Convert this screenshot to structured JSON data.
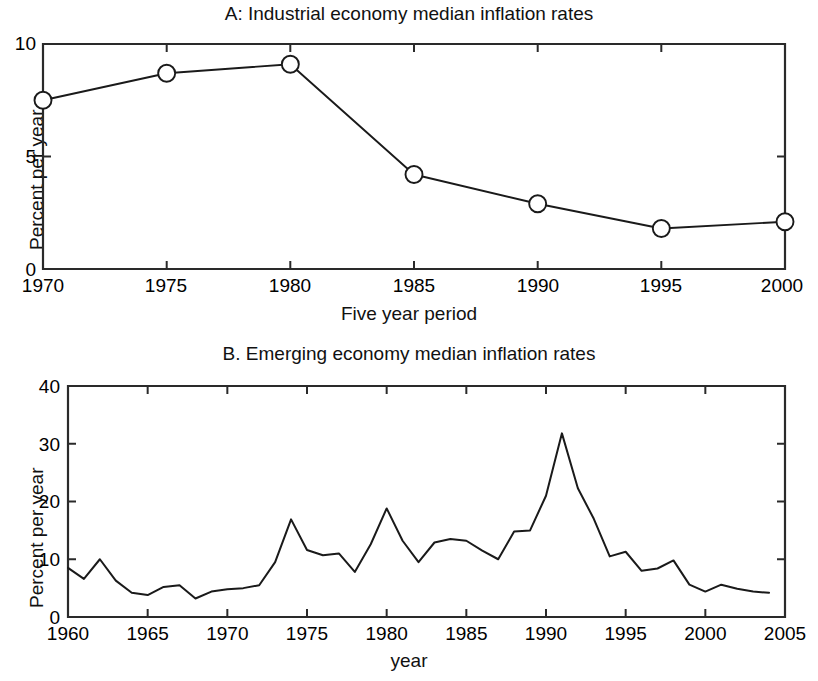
{
  "figure": {
    "panel_a": {
      "title": "A: Industrial economy median inflation rates",
      "ylabel": "Percent per year",
      "xlabel": "Five year period",
      "xticklabels": [
        "1970",
        "1975",
        "1980",
        "1985",
        "1990",
        "1995",
        "2000"
      ],
      "yticklabels": [
        "0",
        "5",
        "10"
      ]
    },
    "panel_b": {
      "title": "B. Emerging economy median inflation rates",
      "ylabel": "Percent per year",
      "xlabel": "year",
      "xticklabels": [
        "1960",
        "1965",
        "1970",
        "1975",
        "1980",
        "1985",
        "1990",
        "1995",
        "2000",
        "2005"
      ],
      "yticklabels": [
        "0",
        "10",
        "20",
        "30",
        "40"
      ]
    }
  },
  "chart_data": [
    {
      "type": "line",
      "panel": "A",
      "title": "A: Industrial economy median inflation rates",
      "xlabel": "Five year period",
      "ylabel": "Percent per year",
      "xlim": [
        1970,
        2000
      ],
      "ylim": [
        0,
        10
      ],
      "xticks": [
        1970,
        1975,
        1980,
        1985,
        1990,
        1995,
        2000
      ],
      "yticks": [
        0,
        5,
        10
      ],
      "grid": false,
      "legend": "none",
      "marker": "open-circle",
      "x": [
        1970,
        1975,
        1980,
        1985,
        1990,
        1995,
        2000
      ],
      "values": [
        7.5,
        8.7,
        9.1,
        4.2,
        2.9,
        1.8,
        2.1
      ]
    },
    {
      "type": "line",
      "panel": "B",
      "title": "B. Emerging economy median inflation rates",
      "xlabel": "year",
      "ylabel": "Percent per year",
      "xlim": [
        1960,
        2005
      ],
      "ylim": [
        0,
        40
      ],
      "xticks": [
        1960,
        1965,
        1970,
        1975,
        1980,
        1985,
        1990,
        1995,
        2000,
        2005
      ],
      "yticks": [
        0,
        10,
        20,
        30,
        40
      ],
      "grid": false,
      "legend": "none",
      "marker": "none",
      "x": [
        1960,
        1961,
        1962,
        1963,
        1964,
        1965,
        1966,
        1967,
        1968,
        1969,
        1970,
        1971,
        1972,
        1973,
        1974,
        1975,
        1976,
        1977,
        1978,
        1979,
        1980,
        1981,
        1982,
        1983,
        1984,
        1985,
        1986,
        1987,
        1988,
        1989,
        1990,
        1991,
        1992,
        1993,
        1994,
        1995,
        1996,
        1997,
        1998,
        1999,
        2000,
        2001,
        2002,
        2003,
        2004
      ],
      "values": [
        8.5,
        6.6,
        10.0,
        6.3,
        4.2,
        3.8,
        5.2,
        5.5,
        3.2,
        4.4,
        4.8,
        5.0,
        5.5,
        9.5,
        16.9,
        11.6,
        10.7,
        11.0,
        7.8,
        12.6,
        18.8,
        13.2,
        9.5,
        12.9,
        13.5,
        13.2,
        11.5,
        10.0,
        14.8,
        15.0,
        21.0,
        31.8,
        22.3,
        17.0,
        10.5,
        11.3,
        8.0,
        8.4,
        9.8,
        5.6,
        4.4,
        5.6,
        4.9,
        4.4,
        4.2
      ]
    }
  ]
}
